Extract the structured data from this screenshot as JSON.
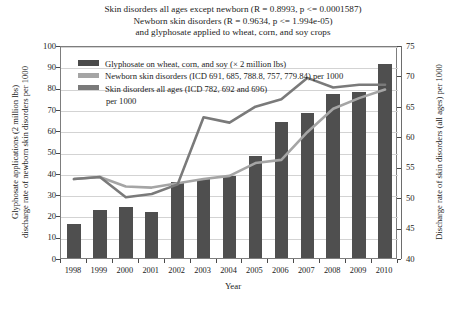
{
  "chart_data": {
    "type": "bar",
    "title": "Skin disorders all ages except newborn (R = 0.8993, p <= 0.0001587) Newborn skin disorders (R = 0.9634, p <= 1.994e-05) and glyphosate applied to wheat, corn, and soy crops",
    "title_lines": [
      "Skin disorders all ages except newborn (R = 0.8993, p <= 0.0001587)",
      "Newborn skin disorders (R = 0.9634, p <= 1.994e-05)",
      "and glyphosate applied to wheat, corn, and soy crops"
    ],
    "xlabel": "Year",
    "ylabel": "Glyphosate applications (2 million lbs) discharge rate of newborn skin disorders per 1000",
    "ylabel_lines": [
      "Glyphosate applications (2 million lbs)",
      "discharge rate of newborn skin disorders per 1000"
    ],
    "y2label": "Discharge rate of skin disorders (all ages) per 1000",
    "categories": [
      1998,
      1999,
      2000,
      2001,
      2002,
      2003,
      2004,
      2005,
      2006,
      2007,
      2008,
      2009,
      2010
    ],
    "xticklabels": [
      "1998",
      "1999",
      "2000",
      "2001",
      "2002",
      "2003",
      "2004",
      "2005",
      "2006",
      "2007",
      "2008",
      "2009",
      "2010"
    ],
    "ylim": [
      0,
      100
    ],
    "yticks": [
      0,
      10,
      20,
      30,
      40,
      50,
      60,
      70,
      80,
      90,
      100
    ],
    "yticklabels": [
      "0",
      "10",
      "20",
      "30",
      "40",
      "50",
      "60",
      "70",
      "80",
      "90",
      "100"
    ],
    "y2lim": [
      40,
      75
    ],
    "y2ticks": [
      40,
      45,
      50,
      55,
      60,
      65,
      70,
      75
    ],
    "y2ticklabels": [
      "40",
      "45",
      "50",
      "55",
      "60",
      "65",
      "70",
      "75"
    ],
    "grid": true,
    "legend_position": "upper left",
    "series": [
      {
        "name": "Glyphosate on wheat, corn, and soy (× 2 million lbs)",
        "type": "bar",
        "axis": "left",
        "color": "#4f4f4f",
        "legend_icon": "bar-swatch",
        "values": [
          16,
          22.5,
          24,
          21.5,
          35.5,
          37,
          38.5,
          48,
          64,
          68,
          77,
          78,
          91
        ]
      },
      {
        "name": "Newborn skin disorders (ICD 691, 685, 788.8, 757, 779.84) per 1000",
        "type": "line",
        "axis": "left",
        "color": "#a5a5a5",
        "legend_icon": "line-swatch",
        "values": [
          38,
          39,
          34.5,
          34,
          36,
          38,
          39.5,
          45.5,
          47,
          60,
          71,
          76,
          80
        ]
      },
      {
        "name": "Skin disorders all ages (ICD 782, 692 and 696) per 1000",
        "name_lines": [
          "Skin disorders all ages (ICD 782, 692 and 696)",
          "per 1000"
        ],
        "type": "line",
        "axis": "right",
        "color": "#7a7a7a",
        "legend_icon": "line-swatch",
        "values": [
          53.3,
          53.6,
          50.3,
          50.8,
          52.3,
          63.5,
          62.6,
          65.3,
          66.5,
          70,
          68.4,
          68.8,
          68.8
        ],
        "values_left_scale": [
          38,
          39,
          29.5,
          31,
          35.5,
          67,
          64.5,
          72,
          75.5,
          85.5,
          81,
          82.3,
          82.3
        ]
      }
    ]
  },
  "legend": {
    "items": [
      {
        "label": "Glyphosate on wheat, corn, and soy (× 2 million lbs)",
        "swatch": "bar-swatch"
      },
      {
        "label": "Newborn skin disorders (ICD 691, 685, 788.8, 757, 779.84) per 1000",
        "swatch": "line-swatch"
      },
      {
        "label": "Skin disorders all ages (ICD 782, 692 and 696)",
        "label2": "per 1000",
        "swatch": "line-swatch"
      }
    ]
  }
}
